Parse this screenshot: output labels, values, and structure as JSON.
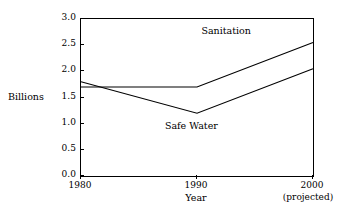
{
  "chart_data": {
    "type": "line",
    "title": "",
    "xlabel": "Year",
    "ylabel": "Billions",
    "x": [
      1980,
      1990,
      2000
    ],
    "xtick_labels": [
      "1980",
      "1990",
      "2000"
    ],
    "xtick_sublabels": [
      "",
      "",
      "(projected)"
    ],
    "ytick_labels": [
      "0.0",
      "0.5",
      "1.0",
      "1.5",
      "2.0",
      "2.5",
      "3.0"
    ],
    "ytick_values": [
      0.0,
      0.5,
      1.0,
      1.5,
      2.0,
      2.5,
      3.0
    ],
    "ylim": [
      0.0,
      3.0
    ],
    "xlim": [
      1980,
      2000
    ],
    "grid": false,
    "legend_position": "inline-annotation",
    "series": [
      {
        "name": "Sanitation",
        "values": [
          1.7,
          1.7,
          2.55
        ],
        "color": "#000000",
        "label_x": 1992.6,
        "label_y": 2.75
      },
      {
        "name": "Safe Water",
        "values": [
          1.8,
          1.2,
          2.05
        ],
        "color": "#000000",
        "label_x": 1989.6,
        "label_y": 0.93
      }
    ],
    "annotations": [
      {
        "text": "Sanitation"
      },
      {
        "text": "Safe Water"
      }
    ]
  },
  "axes": {
    "y_title": "Billions",
    "x_title": "Year",
    "y_ticks": [
      {
        "label": "3.0",
        "value": 3.0
      },
      {
        "label": "2.5",
        "value": 2.5
      },
      {
        "label": "2.0",
        "value": 2.0
      },
      {
        "label": "1.5",
        "value": 1.5
      },
      {
        "label": "1.0",
        "value": 1.0
      },
      {
        "label": "0.5",
        "value": 0.5
      },
      {
        "label": "0.0",
        "value": 0.0
      }
    ],
    "x_ticks": [
      {
        "label": "1980",
        "sublabel": "",
        "value": 1980
      },
      {
        "label": "1990",
        "sublabel": "",
        "value": 1990
      },
      {
        "label": "2000",
        "sublabel": "(projected)",
        "value": 2000
      }
    ]
  },
  "style": {
    "line_color": "#000000",
    "axis_color": "#000000",
    "background": "#ffffff"
  }
}
